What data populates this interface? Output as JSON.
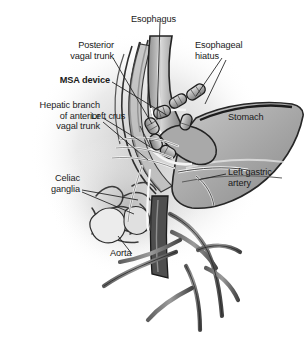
{
  "figure": {
    "style": "greyscale medical line illustration",
    "background_color": "#ffffff",
    "ink_color": "#1a1a1a"
  },
  "labels": [
    {
      "id": "esophagus",
      "text": "Esophagus",
      "bold": false
    },
    {
      "id": "esophageal-hiatus",
      "text": "Esophageal\nhiatus",
      "bold": false
    },
    {
      "id": "posterior-vagal-trunk",
      "text": "Posterior\nvagal trunk",
      "bold": false
    },
    {
      "id": "msa-device",
      "text": "MSA device",
      "bold": true
    },
    {
      "id": "hepatic-branch",
      "text": "Hepatic branch\nof anterior\nvagal trunk",
      "bold": false
    },
    {
      "id": "left-crus",
      "text": "Left crus",
      "bold": false
    },
    {
      "id": "stomach",
      "text": "Stomach",
      "bold": false
    },
    {
      "id": "left-gastric-artery",
      "text": "Left gastric\nartery",
      "bold": false
    },
    {
      "id": "celiac-ganglia",
      "text": "Celiac\nganglia",
      "bold": false
    },
    {
      "id": "aorta",
      "text": "Aorta",
      "bold": false
    }
  ],
  "anatomy": {
    "esophagus": "vertical tube descending through the hiatus",
    "msa_device": "chain of cylindrical magnetic beads encircling the distal esophagus",
    "stomach": "large grey fundus body to the right",
    "aorta": "dark vertical vessel behind the stomach",
    "celiac_ganglia": "tangled nerve plexus at lower left",
    "vessels": "branching arterial tree descending below the celiac axis"
  },
  "palette": {
    "tissue_light": "#d8d8d8",
    "tissue_mid": "#9e9e9e",
    "tissue_dark": "#6a6a6a",
    "outline": "#2b2b2b",
    "device": "#b4b4b4",
    "highlight": "#f2f2f2"
  }
}
